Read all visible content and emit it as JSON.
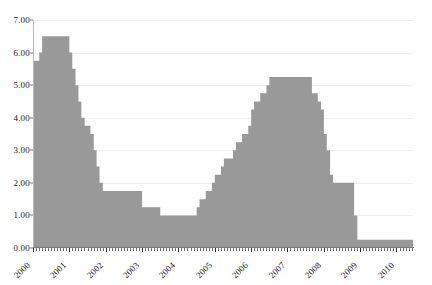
{
  "chart_data": {
    "type": "area",
    "title": "",
    "subtitle": "",
    "xlabel": "",
    "ylabel": "",
    "grid": true,
    "legend": false,
    "legend_position": "none",
    "series_name": "Rate",
    "series_color": "#999999",
    "axis_color": "#7a7a7a",
    "gridline_color": "#f0f0f0",
    "text_color": "#1a1a1a",
    "ylim": [
      0.0,
      7.0
    ],
    "ytick_values": [
      0.0,
      1.0,
      2.0,
      3.0,
      4.0,
      5.0,
      6.0,
      7.0
    ],
    "ytick_labels": [
      "0.00",
      "1.00",
      "2.00",
      "3.00",
      "4.00",
      "5.00",
      "6.00",
      "7.00"
    ],
    "xlim": [
      2000.0,
      2010.45
    ],
    "xtick_values": [
      2000,
      2001,
      2002,
      2003,
      2004,
      2005,
      2006,
      2007,
      2008,
      2009,
      2010
    ],
    "xtick_labels": [
      "2000",
      "2001",
      "2002",
      "2003",
      "2004",
      "2005",
      "2006",
      "2007",
      "2008",
      "2009",
      "2010"
    ],
    "x_minor_tick_interval": 0.0833,
    "step_style": "post",
    "x": [
      2000.0,
      2000.08,
      2000.17,
      2000.25,
      2000.33,
      2000.42,
      2000.5,
      2000.58,
      2000.67,
      2000.75,
      2000.83,
      2000.92,
      2001.0,
      2001.08,
      2001.17,
      2001.25,
      2001.33,
      2001.42,
      2001.5,
      2001.58,
      2001.67,
      2001.75,
      2001.83,
      2001.92,
      2002.0,
      2002.25,
      2002.5,
      2002.75,
      2003.0,
      2003.25,
      2003.5,
      2003.75,
      2004.0,
      2004.25,
      2004.5,
      2004.58,
      2004.67,
      2004.75,
      2004.83,
      2004.92,
      2005.0,
      2005.17,
      2005.25,
      2005.33,
      2005.5,
      2005.58,
      2005.75,
      2005.92,
      2006.0,
      2006.08,
      2006.25,
      2006.33,
      2006.42,
      2006.5,
      2006.58,
      2006.75,
      2007.0,
      2007.25,
      2007.5,
      2007.67,
      2007.83,
      2007.92,
      2008.0,
      2008.08,
      2008.17,
      2008.25,
      2008.33,
      2008.5,
      2008.75,
      2008.83,
      2008.92,
      2009.0,
      2009.5,
      2010.0,
      2010.45
    ],
    "values": [
      5.75,
      5.75,
      6.0,
      6.5,
      6.5,
      6.5,
      6.5,
      6.5,
      6.5,
      6.5,
      6.5,
      6.5,
      6.0,
      5.5,
      5.0,
      4.5,
      4.0,
      3.75,
      3.75,
      3.5,
      3.0,
      2.5,
      2.0,
      1.75,
      1.75,
      1.75,
      1.75,
      1.75,
      1.25,
      1.25,
      1.0,
      1.0,
      1.0,
      1.0,
      1.25,
      1.5,
      1.5,
      1.75,
      1.75,
      2.0,
      2.25,
      2.5,
      2.75,
      2.75,
      3.0,
      3.25,
      3.5,
      3.75,
      4.25,
      4.5,
      4.75,
      4.75,
      5.0,
      5.25,
      5.25,
      5.25,
      5.25,
      5.25,
      5.25,
      4.75,
      4.5,
      4.25,
      3.5,
      3.0,
      2.25,
      2.0,
      2.0,
      2.0,
      2.0,
      1.0,
      0.25,
      0.25,
      0.25,
      0.25,
      0.25
    ],
    "annotations": []
  }
}
